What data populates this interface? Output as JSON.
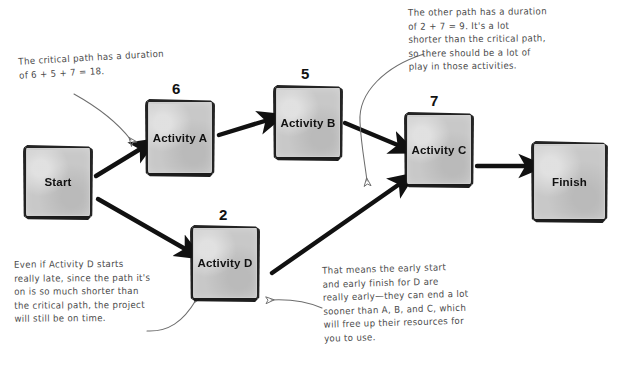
{
  "diagram": {
    "box_fill_color": "#c8c8c6",
    "ink_color": "#111111",
    "annotation_color": "#4a4a4a",
    "nodes": [
      {
        "id": "start",
        "label": "Start",
        "duration": ""
      },
      {
        "id": "activity-a",
        "label": "Activity\nA",
        "duration": "6"
      },
      {
        "id": "activity-b",
        "label": "Activity\nB",
        "duration": "5"
      },
      {
        "id": "activity-c",
        "label": "Activity\nC",
        "duration": "7"
      },
      {
        "id": "activity-d",
        "label": "Activity\nD",
        "duration": "2"
      },
      {
        "id": "finish",
        "label": "Finish",
        "duration": ""
      }
    ],
    "edges": [
      {
        "from": "start",
        "to": "activity-a"
      },
      {
        "from": "start",
        "to": "activity-d"
      },
      {
        "from": "activity-a",
        "to": "activity-b"
      },
      {
        "from": "activity-b",
        "to": "activity-c"
      },
      {
        "from": "activity-d",
        "to": "activity-c"
      },
      {
        "from": "activity-c",
        "to": "finish"
      }
    ],
    "annotations": [
      {
        "id": "note-critical",
        "text": "The critical path has a duration\nof 6 + 5 + 7 = 18.",
        "points_to": "activity-a"
      },
      {
        "id": "note-other",
        "text": "The other path has a duration\nof 2 + 7 = 9. It's a lot\nshorter than the critical path,\nso there should be a lot of\nplay in those activities.",
        "points_to": "activity-d-to-c-edge"
      },
      {
        "id": "note-late",
        "text": "Even if Activity D starts\nreally late, since the path it's\non is so much shorter than\nthe critical path, the project\nwill still be on time.",
        "points_to": "activity-d"
      },
      {
        "id": "note-early",
        "text": "That means the early start\nand early finish for D are\nreally early—they can end a lot\nsooner than A, B, and C, which\nwill free up their resources for\nyou to use.",
        "points_to": "activity-d"
      }
    ]
  }
}
